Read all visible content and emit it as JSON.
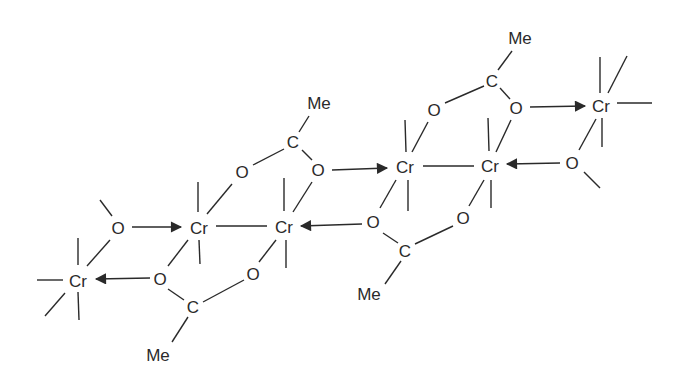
{
  "diagram": {
    "title": "",
    "type": "chemical-structure",
    "colors": {
      "ink": "#2a2a2a",
      "background": "#ffffff"
    },
    "atoms": [
      {
        "id": "cr_far_left",
        "label": "Cr",
        "x": 78,
        "y": 281
      },
      {
        "id": "cr_a",
        "label": "Cr",
        "x": 197,
        "y": 228
      },
      {
        "id": "cr_b",
        "label": "Cr",
        "x": 283,
        "y": 227
      },
      {
        "id": "cr_c",
        "label": "Cr",
        "x": 403,
        "y": 167
      },
      {
        "id": "cr_d",
        "label": "Cr",
        "x": 489,
        "y": 166
      },
      {
        "id": "cr_far_right",
        "label": "Cr",
        "x": 601,
        "y": 107
      },
      {
        "id": "o_left_methoxy",
        "label": "O",
        "x": 118,
        "y": 228
      },
      {
        "id": "o_ac1_low",
        "label": "O",
        "x": 160,
        "y": 279
      },
      {
        "id": "c_ac1",
        "label": "C",
        "x": 193,
        "y": 306
      },
      {
        "id": "me_ac1",
        "label": "Me",
        "x": 160,
        "y": 355
      },
      {
        "id": "o_ac1_high",
        "label": "O",
        "x": 253,
        "y": 273
      },
      {
        "id": "o_ac2_left",
        "label": "O",
        "x": 242,
        "y": 172
      },
      {
        "id": "c_ac2",
        "label": "C",
        "x": 293,
        "y": 143
      },
      {
        "id": "me_ac2",
        "label": "Me",
        "x": 318,
        "y": 103
      },
      {
        "id": "o_ac2_right",
        "label": "O",
        "x": 318,
        "y": 170
      },
      {
        "id": "o_ac3_left",
        "label": "O",
        "x": 373,
        "y": 222
      },
      {
        "id": "c_ac3",
        "label": "C",
        "x": 405,
        "y": 250
      },
      {
        "id": "me_ac3",
        "label": "Me",
        "x": 370,
        "y": 294
      },
      {
        "id": "o_ac3_right",
        "label": "O",
        "x": 463,
        "y": 218
      },
      {
        "id": "o_ac4_left",
        "label": "O",
        "x": 434,
        "y": 110
      },
      {
        "id": "c_ac4",
        "label": "C",
        "x": 492,
        "y": 82
      },
      {
        "id": "me_ac4",
        "label": "Me",
        "x": 520,
        "y": 38
      },
      {
        "id": "o_ac4_right",
        "label": "O",
        "x": 516,
        "y": 108
      },
      {
        "id": "o_right_methoxy",
        "label": "O",
        "x": 572,
        "y": 163
      }
    ],
    "dative_bonds": [
      {
        "from": "o_left_methoxy",
        "to": "cr_a"
      },
      {
        "from": "o_ac1_low",
        "to": "cr_far_left"
      },
      {
        "from": "o_ac2_right",
        "to": "cr_c"
      },
      {
        "from": "o_ac3_left",
        "to": "cr_b"
      },
      {
        "from": "o_ac4_right",
        "to": "cr_far_right"
      },
      {
        "from": "o_right_methoxy",
        "to": "cr_d"
      }
    ],
    "metal_metal_bonds": [
      {
        "from": "cr_a",
        "to": "cr_b"
      },
      {
        "from": "cr_c",
        "to": "cr_d"
      }
    ]
  }
}
